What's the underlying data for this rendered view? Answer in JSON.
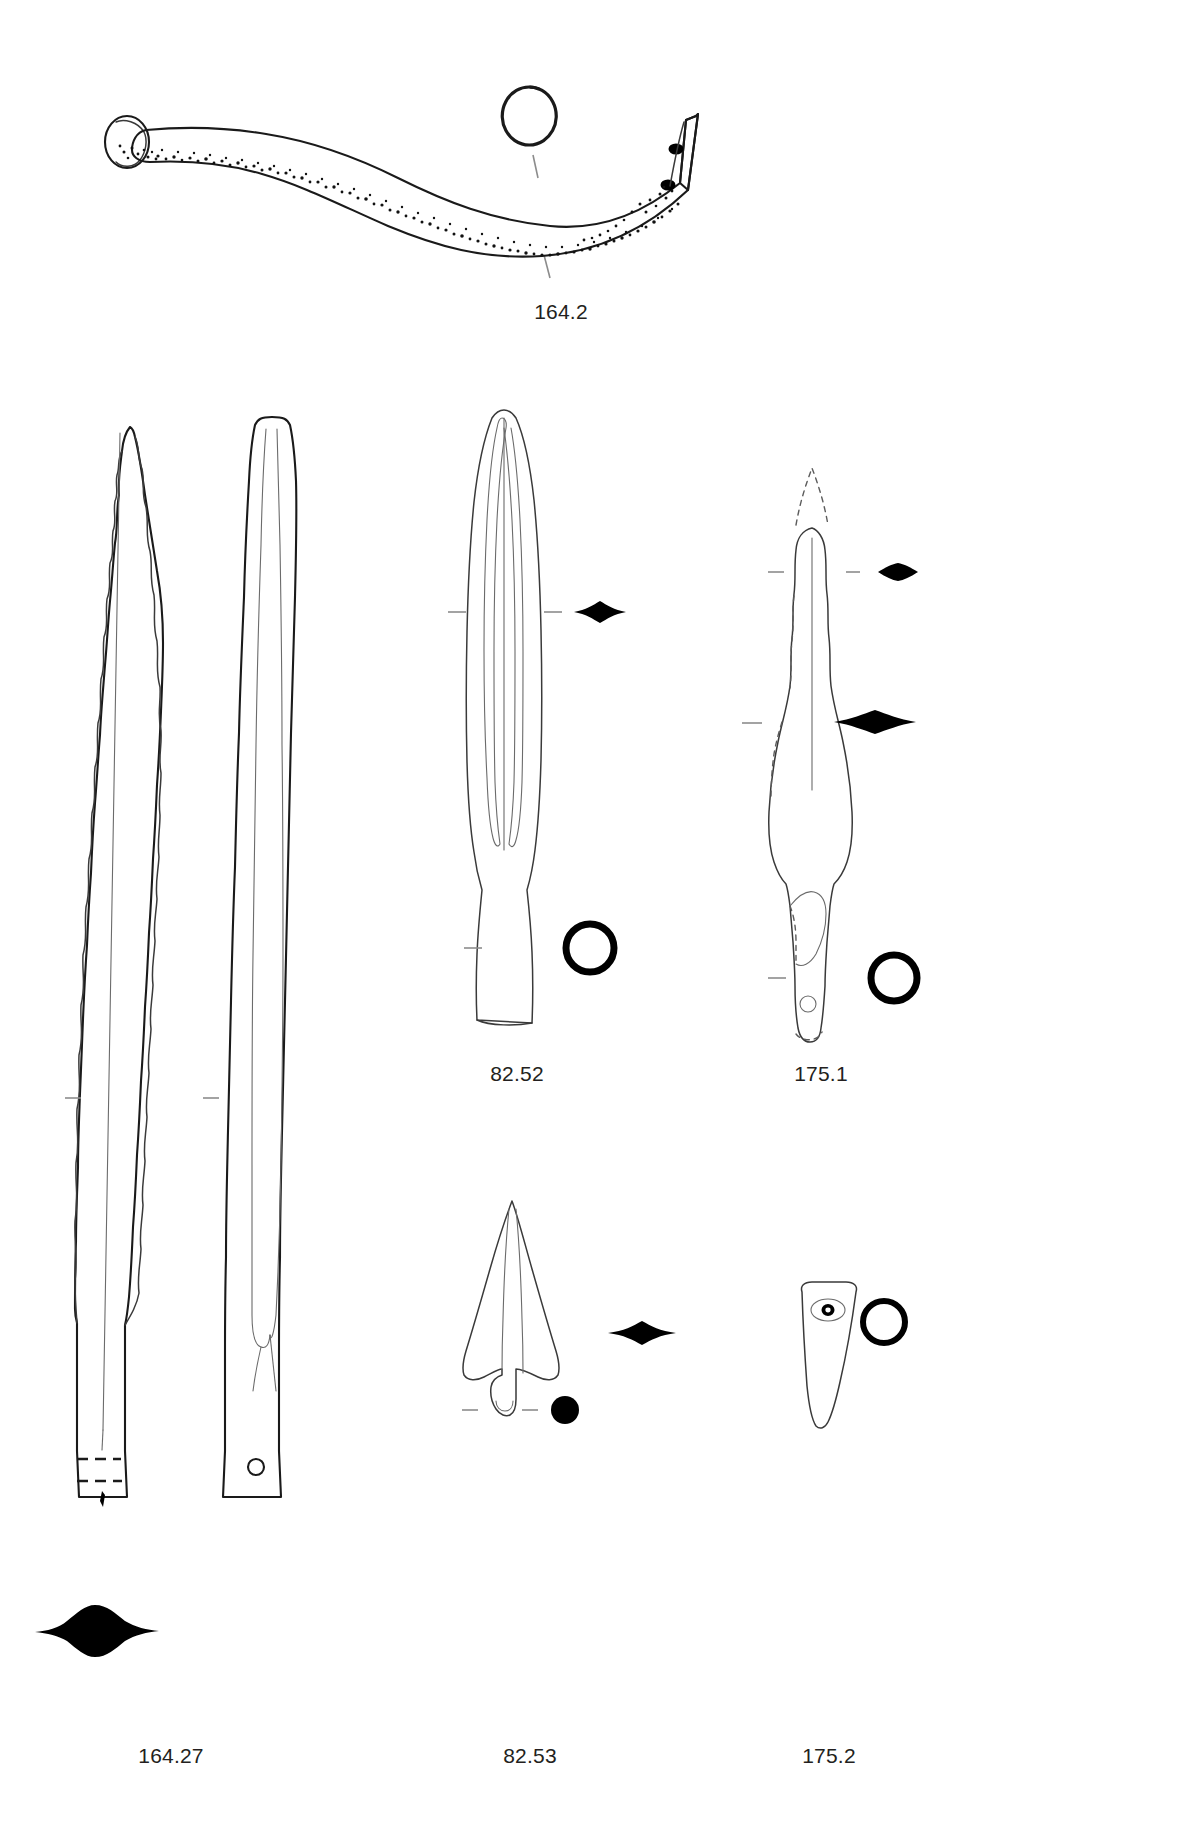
{
  "plate": {
    "kind": "archaeological-illustration-plate",
    "background_color": "#ffffff",
    "ink_color": "#1a1a1a",
    "caption_color": "#231f20",
    "width": 1189,
    "height": 1834
  },
  "figures": [
    {
      "id": "fig-164-2",
      "caption": "164.2",
      "object": "curved-pin-or-hook",
      "views": [
        "profile"
      ],
      "sections": [
        "circular-section-outline"
      ],
      "caption_x": 501,
      "caption_y": 300
    },
    {
      "id": "fig-164-27",
      "caption": "164.27",
      "object": "long-socketed-blade",
      "views": [
        "face",
        "edge-profile"
      ],
      "sections": [
        "lenticular-solid-section"
      ],
      "caption_x": 171,
      "caption_y": 1754
    },
    {
      "id": "fig-82-52",
      "caption": "82.52",
      "object": "socketed-spearhead",
      "views": [
        "face"
      ],
      "sections": [
        "lenticular-solid-section",
        "circular-ring-section"
      ],
      "caption_x": 517,
      "caption_y": 1072
    },
    {
      "id": "fig-175-1",
      "caption": "175.1",
      "object": "socketed-spearhead-with-lug",
      "views": [
        "face"
      ],
      "sections": [
        "lenticular-solid-section-small",
        "lenticular-solid-section-large",
        "circular-ring-section"
      ],
      "caption_x": 821,
      "caption_y": 1072
    },
    {
      "id": "fig-82-53",
      "caption": "82.53",
      "object": "tanged-arrowhead-or-javelin-head",
      "views": [
        "face"
      ],
      "sections": [
        "lenticular-solid-section",
        "circular-solid-dot-section"
      ],
      "caption_x": 530,
      "caption_y": 1754
    },
    {
      "id": "fig-175-2",
      "caption": "175.2",
      "object": "socketed-ferrule-fragment",
      "views": [
        "face"
      ],
      "sections": [
        "circular-ring-section"
      ],
      "caption_x": 829,
      "caption_y": 1754
    }
  ]
}
